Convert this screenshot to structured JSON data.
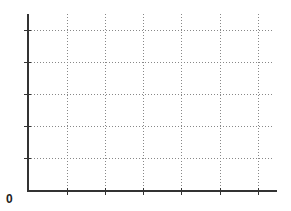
{
  "chart_data": {
    "type": "line",
    "title": "",
    "xlabel": "",
    "ylabel": "",
    "origin_label": "0",
    "x_ticks": 6,
    "y_ticks": 5,
    "grid": true,
    "grid_style": "dotted",
    "series": [],
    "tick_labels_x": [],
    "tick_labels_y": [],
    "legend": null
  },
  "layout": {
    "axis_color": "#333333",
    "grid_color": "#888888",
    "origin": {
      "x": 28,
      "y": 191
    },
    "y_axis_top": 14,
    "x_axis_right": 277,
    "grid_x_right": 272,
    "x_grid": [
      67,
      105,
      143,
      181,
      220,
      258
    ],
    "y_grid": [
      30,
      62,
      94,
      126,
      158
    ]
  }
}
